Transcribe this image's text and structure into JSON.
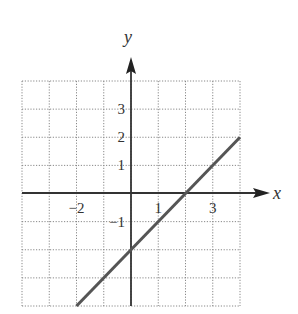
{
  "chart_data": {
    "type": "line",
    "title": "",
    "xlabel": "x",
    "ylabel": "y",
    "xlim": [
      -4,
      4
    ],
    "ylim": [
      -4,
      4
    ],
    "grid": true,
    "grid_style": "dotted",
    "x_tick_labels": [
      {
        "value": -2,
        "label": "−2"
      },
      {
        "value": 1,
        "label": "1"
      },
      {
        "value": 3,
        "label": "3"
      }
    ],
    "y_tick_labels": [
      {
        "value": 3,
        "label": "3"
      },
      {
        "value": 2,
        "label": "2"
      },
      {
        "value": 1,
        "label": "1"
      },
      {
        "value": -1,
        "label": "−1"
      }
    ],
    "series": [
      {
        "name": "line",
        "equation": "y = x - 2",
        "x": [
          -2,
          4
        ],
        "y": [
          -4,
          2
        ],
        "color": "#555555"
      }
    ],
    "legend": null
  },
  "labels": {
    "x_axis": "x",
    "y_axis": "y",
    "x_ticks": [
      "−2",
      "1",
      "3"
    ],
    "y_ticks": [
      "3",
      "2",
      "1",
      "−1"
    ]
  }
}
